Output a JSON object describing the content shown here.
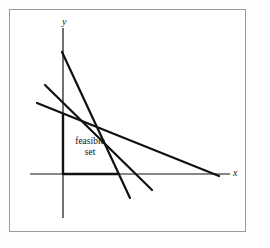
{
  "figure": {
    "kind": "linear-programming-feasible-set-diagram",
    "background_color": "#ffffff",
    "frame_color": "#9a9a9a",
    "ink_color": "#111111"
  },
  "axes": {
    "x_label": "x",
    "y_label": "y",
    "x_axis": {
      "x1": 30,
      "y1": 174,
      "x2": 230,
      "y2": 174,
      "width": 1.2
    },
    "y_axis": {
      "x1": 63,
      "y1": 28,
      "x2": 63,
      "y2": 218,
      "width": 1.2
    }
  },
  "annotations": {
    "feasible_set_line1": "feasible",
    "feasible_set_line2": "set"
  },
  "chart_data": {
    "type": "line",
    "title": "",
    "xlabel": "x",
    "ylabel": "y",
    "grid": false,
    "legend": "none",
    "constraint_lines": [
      {
        "name": "steep-constraint",
        "x1": 62,
        "y1": 52,
        "x2": 130,
        "y2": 198,
        "width": 2.2,
        "description": "steepest line from high on y-axis down past x-axis"
      },
      {
        "name": "medium-constraint",
        "x1": 45,
        "y1": 85,
        "x2": 152,
        "y2": 190,
        "width": 2.2,
        "description": "middle slope line crossing the others"
      },
      {
        "name": "shallow-constraint",
        "x1": 37,
        "y1": 103,
        "x2": 219,
        "y2": 176,
        "width": 2.2,
        "description": "flattest line meeting the x-axis at the right"
      }
    ],
    "feasible_region_boundary": [
      {
        "name": "left-edge",
        "x1": 63,
        "y1": 113,
        "x2": 63,
        "y2": 175,
        "width": 2.4
      },
      {
        "name": "bottom-edge",
        "x1": 63,
        "y1": 174,
        "x2": 118,
        "y2": 174,
        "width": 2.4
      }
    ],
    "vertices": [
      {
        "label": "",
        "x": 63,
        "y": 174
      },
      {
        "label": "",
        "x": 63,
        "y": 113
      },
      {
        "label": "",
        "x": 92,
        "y": 118
      },
      {
        "label": "",
        "x": 101,
        "y": 131
      },
      {
        "label": "",
        "x": 118,
        "y": 174
      }
    ]
  }
}
